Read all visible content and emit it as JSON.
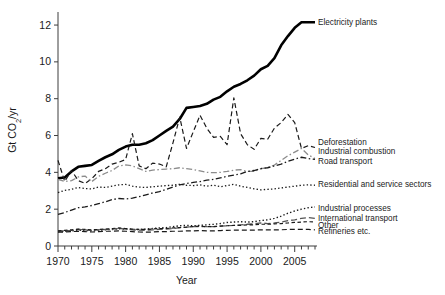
{
  "chart_data": {
    "type": "line",
    "title": "",
    "xlabel": "Year",
    "ylabel": "Gt CO2/yr",
    "ylabel_parts": {
      "pre": "Gt CO",
      "sub": "2",
      "post": "/yr"
    },
    "xlim": [
      1970,
      2008
    ],
    "ylim": [
      0,
      12.6
    ],
    "grid": false,
    "legend_position": "right-inline-labels",
    "xticks": [
      1970,
      1975,
      1980,
      1985,
      1990,
      1995,
      2000,
      2005
    ],
    "xtick_labels": [
      "1970",
      "1975",
      "1980",
      "1985",
      "1990",
      "1995",
      "2000",
      "2005"
    ],
    "xminor_step": 1,
    "yticks": [
      0,
      2,
      4,
      6,
      8,
      10,
      12
    ],
    "ytick_labels": [
      "0",
      "2",
      "4",
      "6",
      "8",
      "10",
      "12"
    ],
    "x": [
      1970,
      1971,
      1972,
      1973,
      1974,
      1975,
      1976,
      1977,
      1978,
      1979,
      1980,
      1981,
      1982,
      1983,
      1984,
      1985,
      1986,
      1987,
      1988,
      1989,
      1990,
      1991,
      1992,
      1993,
      1994,
      1995,
      1996,
      1997,
      1998,
      1999,
      2000,
      2001,
      2002,
      2003,
      2004,
      2005,
      2006,
      2007,
      2008
    ],
    "series": [
      {
        "name": "Electricity plants",
        "style": "solid",
        "color": "#000000",
        "width": 2.6,
        "label": "Electricity plants",
        "label_x": 2009.5,
        "label_y": 12.15,
        "values": [
          3.68,
          3.72,
          4.05,
          4.3,
          4.35,
          4.4,
          4.62,
          4.82,
          4.98,
          5.22,
          5.4,
          5.5,
          5.5,
          5.58,
          5.75,
          6.0,
          6.25,
          6.48,
          6.9,
          7.5,
          7.55,
          7.6,
          7.72,
          7.95,
          8.1,
          8.4,
          8.65,
          8.8,
          9.0,
          9.25,
          9.6,
          9.78,
          10.2,
          10.9,
          11.4,
          11.85,
          12.15,
          12.15,
          12.15
        ]
      },
      {
        "name": "Deforestation",
        "style": "dashed",
        "color": "#1a1a1a",
        "width": 1.2,
        "label": "Deforestation",
        "label_x": 2009.5,
        "label_y": 5.65,
        "values": [
          4.65,
          3.5,
          4.1,
          3.55,
          3.4,
          3.65,
          4.05,
          4.2,
          4.45,
          4.55,
          4.7,
          6.1,
          4.35,
          4.2,
          4.5,
          4.45,
          4.3,
          5.6,
          7.0,
          5.3,
          6.2,
          7.1,
          6.4,
          5.9,
          5.95,
          5.5,
          8.05,
          6.1,
          5.5,
          5.25,
          5.85,
          5.8,
          6.4,
          6.7,
          7.15,
          6.7,
          5.3,
          5.45,
          5.35
        ]
      },
      {
        "name": "Industrial combustion",
        "style": "dash-dot",
        "color": "#8c8c8c",
        "width": 1.3,
        "label": "Industrial combustion",
        "label_x": 2009.5,
        "label_y": 5.15,
        "values": [
          3.62,
          3.5,
          3.55,
          3.75,
          3.8,
          3.5,
          3.78,
          3.95,
          4.1,
          4.35,
          4.4,
          4.35,
          4.2,
          4.05,
          4.12,
          4.15,
          4.18,
          4.2,
          4.25,
          4.2,
          4.15,
          4.08,
          4.0,
          3.98,
          4.0,
          4.05,
          4.12,
          4.15,
          4.05,
          4.05,
          4.2,
          4.25,
          4.4,
          4.65,
          4.9,
          5.1,
          5.3,
          4.95,
          4.75
        ]
      },
      {
        "name": "Road transport",
        "style": "dash-dot",
        "color": "#1a1a1a",
        "width": 1.3,
        "label": "Road transport",
        "label_x": 2009.5,
        "label_y": 4.6,
        "values": [
          1.72,
          1.82,
          1.95,
          2.08,
          2.12,
          2.2,
          2.3,
          2.4,
          2.52,
          2.58,
          2.55,
          2.6,
          2.68,
          2.78,
          2.88,
          2.95,
          3.08,
          3.2,
          3.32,
          3.4,
          3.45,
          3.5,
          3.58,
          3.62,
          3.7,
          3.78,
          3.85,
          3.92,
          4.05,
          4.1,
          4.2,
          4.25,
          4.35,
          4.45,
          4.6,
          4.72,
          4.82,
          4.75,
          4.7
        ]
      },
      {
        "name": "Residential and service sectors",
        "style": "dotted",
        "color": "#1a1a1a",
        "width": 1.3,
        "label": "Residential and service sectors",
        "label_x": 2009.5,
        "label_y": 3.35,
        "values": [
          2.9,
          3.02,
          3.08,
          3.18,
          3.12,
          3.1,
          3.2,
          3.18,
          3.25,
          3.32,
          3.35,
          3.25,
          3.2,
          3.18,
          3.22,
          3.25,
          3.28,
          3.3,
          3.35,
          3.3,
          3.28,
          3.32,
          3.25,
          3.3,
          3.22,
          3.28,
          3.35,
          3.25,
          3.18,
          3.1,
          3.05,
          3.08,
          3.1,
          3.15,
          3.2,
          3.25,
          3.3,
          3.32,
          3.3
        ]
      },
      {
        "name": "Industrial processes",
        "style": "dotted",
        "color": "#1a1a1a",
        "width": 1.4,
        "label": "Industrial processes",
        "label_x": 2009.5,
        "label_y": 2.05,
        "values": [
          0.78,
          0.8,
          0.82,
          0.85,
          0.85,
          0.82,
          0.86,
          0.88,
          0.9,
          0.93,
          0.92,
          0.9,
          0.9,
          0.92,
          0.95,
          0.98,
          1.0,
          1.05,
          1.1,
          1.12,
          1.1,
          1.12,
          1.15,
          1.18,
          1.22,
          1.28,
          1.3,
          1.32,
          1.3,
          1.32,
          1.38,
          1.42,
          1.5,
          1.62,
          1.78,
          1.9,
          2.0,
          2.08,
          2.12
        ]
      },
      {
        "name": "International transport",
        "style": "long-dash",
        "color": "#555555",
        "width": 1.3,
        "label": "International transport",
        "label_x": 2009.5,
        "label_y": 1.52,
        "values": [
          0.8,
          0.82,
          0.85,
          0.9,
          0.88,
          0.85,
          0.88,
          0.9,
          0.92,
          0.95,
          0.92,
          0.88,
          0.86,
          0.85,
          0.88,
          0.9,
          0.92,
          0.95,
          1.0,
          1.02,
          1.05,
          1.05,
          1.05,
          1.05,
          1.08,
          1.1,
          1.12,
          1.15,
          1.18,
          1.2,
          1.25,
          1.22,
          1.25,
          1.3,
          1.38,
          1.42,
          1.5,
          1.55,
          1.5
        ]
      },
      {
        "name": "Other",
        "style": "dash-small",
        "color": "#1a1a1a",
        "width": 1.2,
        "label": "Other",
        "label_x": 2009.5,
        "label_y": 1.15,
        "values": [
          0.82,
          0.85,
          0.88,
          0.92,
          0.9,
          0.88,
          0.9,
          0.92,
          0.95,
          0.98,
          0.95,
          0.92,
          0.9,
          0.9,
          0.92,
          0.95,
          0.95,
          0.98,
          1.0,
          1.02,
          1.05,
          1.08,
          1.05,
          1.05,
          1.08,
          1.1,
          1.12,
          1.12,
          1.15,
          1.15,
          1.18,
          1.18,
          1.2,
          1.22,
          1.25,
          1.28,
          1.3,
          1.32,
          1.3
        ]
      },
      {
        "name": "Refineries etc.",
        "style": "dashed",
        "color": "#1a1a1a",
        "width": 1.2,
        "label": "Refineries etc.",
        "label_x": 2009.5,
        "label_y": 0.8,
        "values": [
          0.75,
          0.76,
          0.78,
          0.8,
          0.78,
          0.76,
          0.78,
          0.8,
          0.8,
          0.82,
          0.8,
          0.78,
          0.76,
          0.75,
          0.76,
          0.78,
          0.78,
          0.8,
          0.8,
          0.82,
          0.82,
          0.84,
          0.82,
          0.82,
          0.84,
          0.85,
          0.86,
          0.86,
          0.86,
          0.86,
          0.88,
          0.88,
          0.88,
          0.88,
          0.9,
          0.9,
          0.9,
          0.9,
          0.88
        ]
      }
    ]
  }
}
